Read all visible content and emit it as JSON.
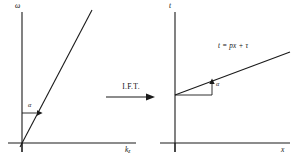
{
  "figure": {
    "transform_arrow": {
      "label": "I.F.T.",
      "icon": "right-arrow-icon",
      "direction": "right"
    },
    "panels": [
      {
        "id": "left",
        "name": "frequency-wavenumber-panel",
        "y_axis_label": "ω",
        "x_axis_label_base": "k",
        "x_axis_label_sub": "z",
        "angle_label": "α",
        "line_through_origin": true,
        "equation": ""
      },
      {
        "id": "right",
        "name": "time-offset-panel",
        "y_axis_label": "t",
        "x_axis_label_base": "x",
        "x_axis_label_sub": "",
        "angle_label": "α",
        "line_through_origin": false,
        "equation": "t = px + τ"
      }
    ]
  },
  "colors": {
    "ink": "#1a1a1a",
    "background": "#ffffff"
  }
}
